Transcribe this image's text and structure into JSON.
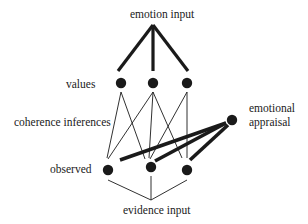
{
  "diagram": {
    "labels": {
      "emotion_input": "emotion input",
      "values": "values",
      "coherence_inferences": "coherence inferences",
      "emotional": "emotional",
      "appraisal": "appraisal",
      "observed": "observed",
      "evidence_input": "evidence input"
    },
    "colors": {
      "ink": "#1a1a1a",
      "background": "#ffffff"
    }
  }
}
